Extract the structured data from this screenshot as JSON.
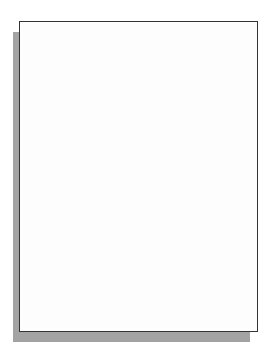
{
  "diagram": {
    "title": "",
    "colors": {
      "person": "#9c9c9c",
      "arrow": "#c3c3c3",
      "frame_border": "#333333",
      "shadow": "#a3a3a3"
    },
    "levels": [
      {
        "level": 1,
        "people": [
          81,
          137
        ],
        "y": 37,
        "link": "horizontal"
      },
      {
        "level": 2,
        "people": [
          84,
          194
        ],
        "y": 104
      },
      {
        "level": 3,
        "people": [
          57,
          111,
          165,
          219
        ],
        "y": 183
      },
      {
        "level": 4,
        "people": [
          43,
          70,
          97,
          124,
          152,
          179,
          206,
          233
        ],
        "y": 268
      }
    ],
    "icons": [
      "person-icon",
      "double-arrow-icon"
    ]
  }
}
